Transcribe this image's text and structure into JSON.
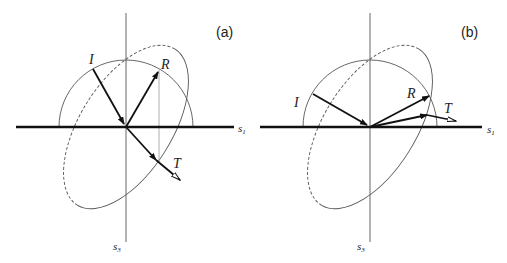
{
  "panels": [
    {
      "id": "a",
      "label": "(a)",
      "axes": {
        "horizontal": "s",
        "horizontal_sub": "1",
        "vertical": "s",
        "vertical_sub": "3"
      },
      "rays": {
        "incident": "I",
        "reflected": "R",
        "transmitted": "T"
      }
    },
    {
      "id": "b",
      "label": "(b)",
      "axes": {
        "horizontal": "s",
        "horizontal_sub": "1",
        "vertical": "s",
        "vertical_sub": "3"
      },
      "rays": {
        "incident": "I",
        "reflected": "R",
        "transmitted": "T"
      }
    }
  ],
  "colors": {
    "line": "#111111",
    "thin": "#555555",
    "guide": "#999999"
  }
}
